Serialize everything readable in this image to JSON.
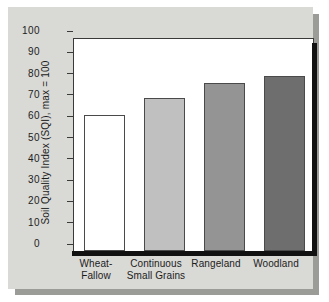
{
  "chart_data": {
    "type": "bar",
    "title": "",
    "xlabel": "",
    "ylabel": "Soil Quality Index (SQI), max = 100",
    "categories": [
      "Wheat-Fallow",
      "Continuous Small Grains",
      "Rangeland",
      "Woodland"
    ],
    "values": [
      64,
      72,
      79,
      82
    ],
    "ylim": [
      0,
      100
    ],
    "ytick_labels": [
      "100",
      "90",
      "80",
      "70",
      "60",
      "50",
      "40",
      "30",
      "20",
      "10",
      "0"
    ],
    "ytick_values": [
      100,
      90,
      80,
      70,
      60,
      50,
      40,
      30,
      20,
      10,
      0
    ],
    "grid": false,
    "legend": null,
    "bar_colors": [
      "#ffffff",
      "#c0c0c0",
      "#949494",
      "#6e6e6e"
    ],
    "bar_edge_color": "#4a4a4a"
  },
  "axis": {
    "y_title": "Soil Quality Index (SQI), max = 100",
    "ticks": [
      {
        "label": "100",
        "value": 100
      },
      {
        "label": "90",
        "value": 90
      },
      {
        "label": "80",
        "value": 80
      },
      {
        "label": "70",
        "value": 70
      },
      {
        "label": "60",
        "value": 60
      },
      {
        "label": "50",
        "value": 50
      },
      {
        "label": "40",
        "value": 40
      },
      {
        "label": "30",
        "value": 30
      },
      {
        "label": "20",
        "value": 20
      },
      {
        "label": "10",
        "value": 10
      },
      {
        "label": "0",
        "value": 0
      }
    ]
  },
  "bars": [
    {
      "category": "Wheat-Fallow",
      "label_line1": "Wheat-",
      "label_line2": "Fallow",
      "value": 64,
      "color": "#ffffff"
    },
    {
      "category": "Continuous Small Grains",
      "label_line1": "Continuous",
      "label_line2": "Small Grains",
      "value": 72,
      "color": "#c0c0c0"
    },
    {
      "category": "Rangeland",
      "label_line1": "Rangeland",
      "label_line2": "",
      "value": 79,
      "color": "#949494"
    },
    {
      "category": "Woodland",
      "label_line1": "Woodland",
      "label_line2": "",
      "value": 82,
      "color": "#6e6e6e"
    }
  ],
  "colors": {
    "card_background": "#d9d9d6",
    "plot_background": "#ffffff",
    "axis_line": "#3a3a3a",
    "axis_heavy": "#111111",
    "text": "#1c1c1c",
    "shadow": "#9b9b98"
  }
}
